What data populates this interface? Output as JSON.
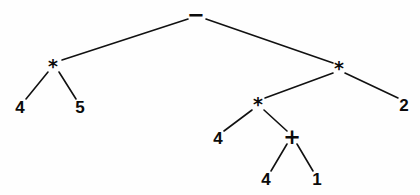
{
  "diagram": {
    "background_color": "#fefefe",
    "stroke_color": "#111111",
    "text_color": "#0b0b0b",
    "width": 420,
    "height": 195,
    "expression": "4 * 5 - 4 * (4 + 1) * 2"
  },
  "nodes": [
    {
      "id": "n0",
      "label": "−",
      "kind": "operator",
      "x": 196,
      "y": 15,
      "class": "op-minus"
    },
    {
      "id": "n1",
      "label": "*",
      "kind": "operator",
      "x": 53,
      "y": 66,
      "class": "op-mul"
    },
    {
      "id": "n2",
      "label": "*",
      "kind": "operator",
      "x": 339,
      "y": 68,
      "class": "op-mul"
    },
    {
      "id": "n3",
      "label": "4",
      "kind": "leaf",
      "x": 20,
      "y": 107,
      "class": "leaf"
    },
    {
      "id": "n4",
      "label": "5",
      "kind": "leaf",
      "x": 80,
      "y": 107,
      "class": "leaf"
    },
    {
      "id": "n5",
      "label": "*",
      "kind": "operator",
      "x": 258,
      "y": 104,
      "class": "op-mul"
    },
    {
      "id": "n6",
      "label": "2",
      "kind": "leaf",
      "x": 404,
      "y": 105,
      "class": "leaf"
    },
    {
      "id": "n7",
      "label": "4",
      "kind": "leaf",
      "x": 218,
      "y": 138,
      "class": "leaf"
    },
    {
      "id": "n8",
      "label": "+",
      "kind": "operator",
      "x": 292,
      "y": 137,
      "class": "op-plus"
    },
    {
      "id": "n9",
      "label": "4",
      "kind": "leaf",
      "x": 266,
      "y": 179,
      "class": "leaf"
    },
    {
      "id": "n10",
      "label": "1",
      "kind": "leaf",
      "x": 317,
      "y": 179,
      "class": "leaf"
    }
  ],
  "edges": [
    {
      "id": "e0",
      "from": "n0",
      "to": "n1",
      "x1": 188,
      "y1": 19,
      "x2": 62,
      "y2": 60
    },
    {
      "id": "e1",
      "from": "n0",
      "to": "n2",
      "x1": 206,
      "y1": 19,
      "x2": 333,
      "y2": 63
    },
    {
      "id": "e2",
      "from": "n1",
      "to": "n3",
      "x1": 48,
      "y1": 72,
      "x2": 26,
      "y2": 99
    },
    {
      "id": "e3",
      "from": "n1",
      "to": "n4",
      "x1": 59,
      "y1": 72,
      "x2": 76,
      "y2": 99
    },
    {
      "id": "e4",
      "from": "n2",
      "to": "n5",
      "x1": 333,
      "y1": 73,
      "x2": 265,
      "y2": 98
    },
    {
      "id": "e5",
      "from": "n2",
      "to": "n6",
      "x1": 345,
      "y1": 73,
      "x2": 398,
      "y2": 98
    },
    {
      "id": "e6",
      "from": "n5",
      "to": "n7",
      "x1": 252,
      "y1": 110,
      "x2": 224,
      "y2": 131
    },
    {
      "id": "e7",
      "from": "n5",
      "to": "n8",
      "x1": 264,
      "y1": 110,
      "x2": 287,
      "y2": 131
    },
    {
      "id": "e8",
      "from": "n8",
      "to": "n9",
      "x1": 287,
      "y1": 144,
      "x2": 271,
      "y2": 171
    },
    {
      "id": "e9",
      "from": "n8",
      "to": "n10",
      "x1": 297,
      "y1": 144,
      "x2": 313,
      "y2": 171
    }
  ]
}
